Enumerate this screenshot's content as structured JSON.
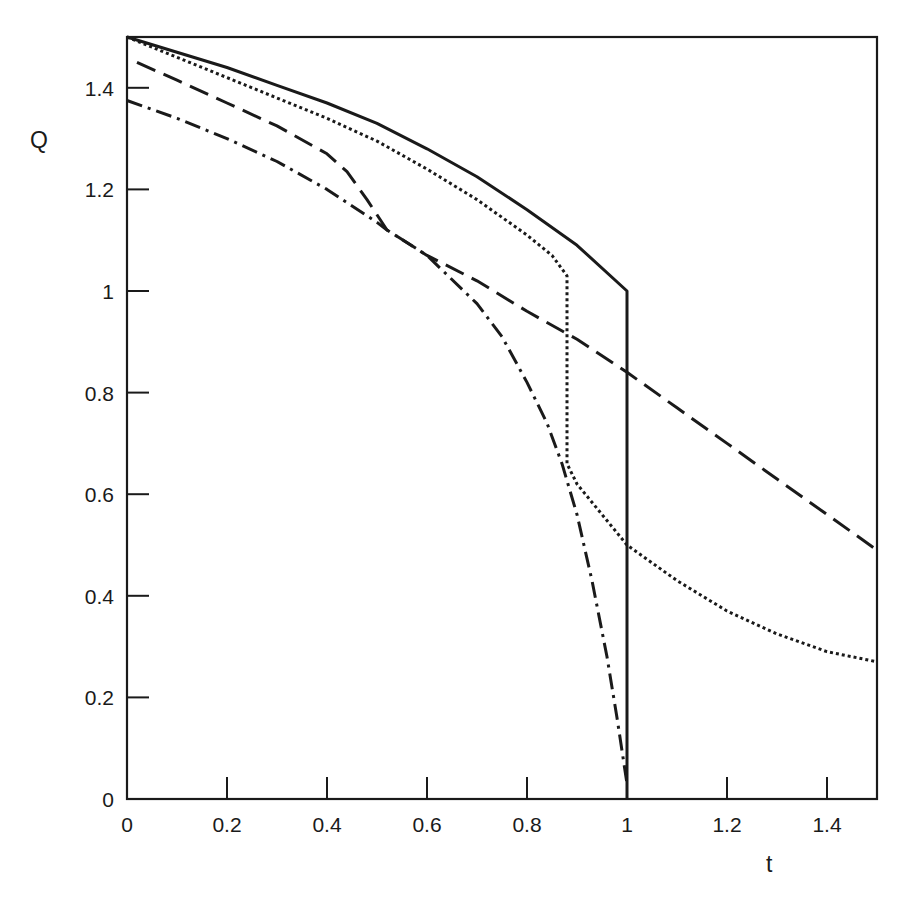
{
  "chart_data": {
    "type": "line",
    "title": "",
    "xlabel": "t",
    "ylabel": "Q",
    "xlim": [
      0,
      1.5
    ],
    "ylim": [
      0,
      1.5
    ],
    "grid": false,
    "legend": null,
    "x_ticks": [
      0,
      0.2,
      0.4,
      0.6,
      0.8,
      1,
      1.2,
      1.4
    ],
    "x_tick_labels": [
      "0",
      "0.2",
      "0.4",
      "0.6",
      "0.8",
      "1",
      "1.2",
      "1.4"
    ],
    "y_ticks": [
      0,
      0.2,
      0.4,
      0.6,
      0.8,
      1,
      1.2,
      1.4
    ],
    "y_tick_labels": [
      "0",
      "0.2",
      "0.4",
      "0.6",
      "0.8",
      "1",
      "1.2",
      "1.4"
    ],
    "series": [
      {
        "name": "solid",
        "style": "solid",
        "x": [
          0,
          0.1,
          0.2,
          0.3,
          0.4,
          0.5,
          0.6,
          0.7,
          0.8,
          0.9,
          1.0,
          1.0
        ],
        "values": [
          1.5,
          1.47,
          1.44,
          1.405,
          1.37,
          1.33,
          1.28,
          1.225,
          1.16,
          1.09,
          1.0,
          0.0
        ]
      },
      {
        "name": "dotted",
        "style": "dotted",
        "x": [
          0,
          0.1,
          0.2,
          0.3,
          0.4,
          0.5,
          0.6,
          0.7,
          0.8,
          0.85,
          0.88,
          0.88,
          0.9,
          0.95,
          1.0,
          1.1,
          1.2,
          1.3,
          1.4,
          1.5
        ],
        "values": [
          1.5,
          1.46,
          1.42,
          1.38,
          1.34,
          1.295,
          1.24,
          1.18,
          1.11,
          1.07,
          1.03,
          0.66,
          0.62,
          0.56,
          0.5,
          0.43,
          0.37,
          0.325,
          0.29,
          0.27
        ]
      },
      {
        "name": "dashed",
        "style": "dashed",
        "x": [
          0.02,
          0.1,
          0.2,
          0.3,
          0.4,
          0.44,
          0.48,
          0.52,
          0.6,
          0.7,
          0.8,
          0.9,
          1.0,
          1.1,
          1.2,
          1.3,
          1.4,
          1.5
        ],
        "values": [
          1.45,
          1.415,
          1.37,
          1.325,
          1.27,
          1.235,
          1.18,
          1.12,
          1.07,
          1.02,
          0.96,
          0.905,
          0.84,
          0.77,
          0.7,
          0.63,
          0.56,
          0.49
        ]
      },
      {
        "name": "dash-dot",
        "style": "dashdot",
        "x": [
          0,
          0.1,
          0.2,
          0.3,
          0.4,
          0.5,
          0.52,
          0.6,
          0.7,
          0.75,
          0.8,
          0.84,
          0.87,
          0.9,
          0.93,
          0.96,
          0.98,
          1.0
        ],
        "values": [
          1.375,
          1.34,
          1.3,
          1.255,
          1.2,
          1.135,
          1.12,
          1.07,
          0.975,
          0.91,
          0.82,
          0.74,
          0.66,
          0.56,
          0.43,
          0.28,
          0.16,
          0.03
        ]
      }
    ]
  },
  "plot": {
    "frame": {
      "left": 127,
      "right": 877,
      "top": 37,
      "bottom": 799
    },
    "line_color": "#1a1a1a"
  }
}
